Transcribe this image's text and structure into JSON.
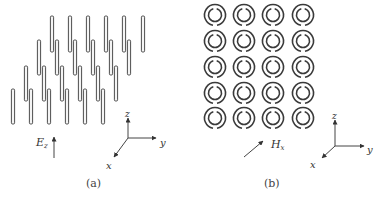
{
  "panels": [
    {
      "id": "a",
      "caption": "(a)",
      "description": "Array of thin metallic wires (rods) aligned along z",
      "rods": {
        "rows": [
          {
            "x": [
              52,
              70,
              88,
              106,
              124,
              143
            ],
            "top": 16,
            "bottom": 52
          },
          {
            "x": [
              39,
              57,
              75,
              93,
              111,
              129
            ],
            "top": 40,
            "bottom": 75
          },
          {
            "x": [
              26,
              44,
              62,
              80,
              98,
              116
            ],
            "top": 66,
            "bottom": 101
          },
          {
            "x": [
              13,
              31,
              49,
              67,
              85,
              103
            ],
            "top": 89,
            "bottom": 124
          }
        ],
        "width": 3.2
      },
      "field": {
        "label": "E",
        "subscript": "z",
        "direction": "up"
      },
      "axes": {
        "z": "z",
        "y": "y",
        "x": "x"
      }
    },
    {
      "id": "b",
      "caption": "(b)",
      "description": "Array of split-ring resonators in the y-z plane",
      "rings": {
        "cols": [
          215,
          244,
          273,
          303
        ],
        "rows": [
          15,
          41,
          67,
          93,
          118
        ],
        "outer_r": 10.5,
        "inner_r": 6.5,
        "outer_gap": "bottom",
        "inner_gap": "top"
      },
      "field": {
        "label": "H",
        "subscript": "x",
        "direction": "diagonal"
      },
      "axes": {
        "z": "z",
        "y": "y",
        "x": "x"
      }
    }
  ],
  "colors": {
    "stroke": "#3a3a3a",
    "rod_fill": "#f4f4f4",
    "text": "#333333"
  }
}
